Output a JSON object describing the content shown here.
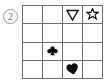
{
  "puzzle": {
    "item_number": "2",
    "grid": {
      "rows": 4,
      "columns": 4,
      "line_color": "#6d6d6d",
      "fill_color": "#000000",
      "background": "#ffffff",
      "cells": [
        [
          {
            "symbol": "",
            "icon": "empty-cell-icon",
            "style": ""
          },
          {
            "symbol": "",
            "icon": "empty-cell-icon",
            "style": ""
          },
          {
            "symbol": "▽",
            "icon": "triangle-down-outline-icon",
            "style": "outline"
          },
          {
            "symbol": "✡",
            "icon": "six-pointed-star-outline-icon",
            "style": "outline"
          }
        ],
        [
          {
            "symbol": "",
            "icon": "empty-cell-icon",
            "style": ""
          },
          {
            "symbol": "",
            "icon": "empty-cell-icon",
            "style": ""
          },
          {
            "symbol": "",
            "icon": "empty-cell-icon",
            "style": ""
          },
          {
            "symbol": "",
            "icon": "empty-cell-icon",
            "style": ""
          }
        ],
        [
          {
            "symbol": "",
            "icon": "empty-cell-icon",
            "style": ""
          },
          {
            "symbol": "♣",
            "icon": "club-filled-icon",
            "style": "filled"
          },
          {
            "symbol": "",
            "icon": "empty-cell-icon",
            "style": ""
          },
          {
            "symbol": "",
            "icon": "empty-cell-icon",
            "style": ""
          }
        ],
        [
          {
            "symbol": "",
            "icon": "empty-cell-icon",
            "style": ""
          },
          {
            "symbol": "",
            "icon": "empty-cell-icon",
            "style": ""
          },
          {
            "symbol": "♥",
            "icon": "heart-filled-icon",
            "style": "filled"
          },
          {
            "symbol": "",
            "icon": "empty-cell-icon",
            "style": ""
          }
        ]
      ]
    }
  }
}
